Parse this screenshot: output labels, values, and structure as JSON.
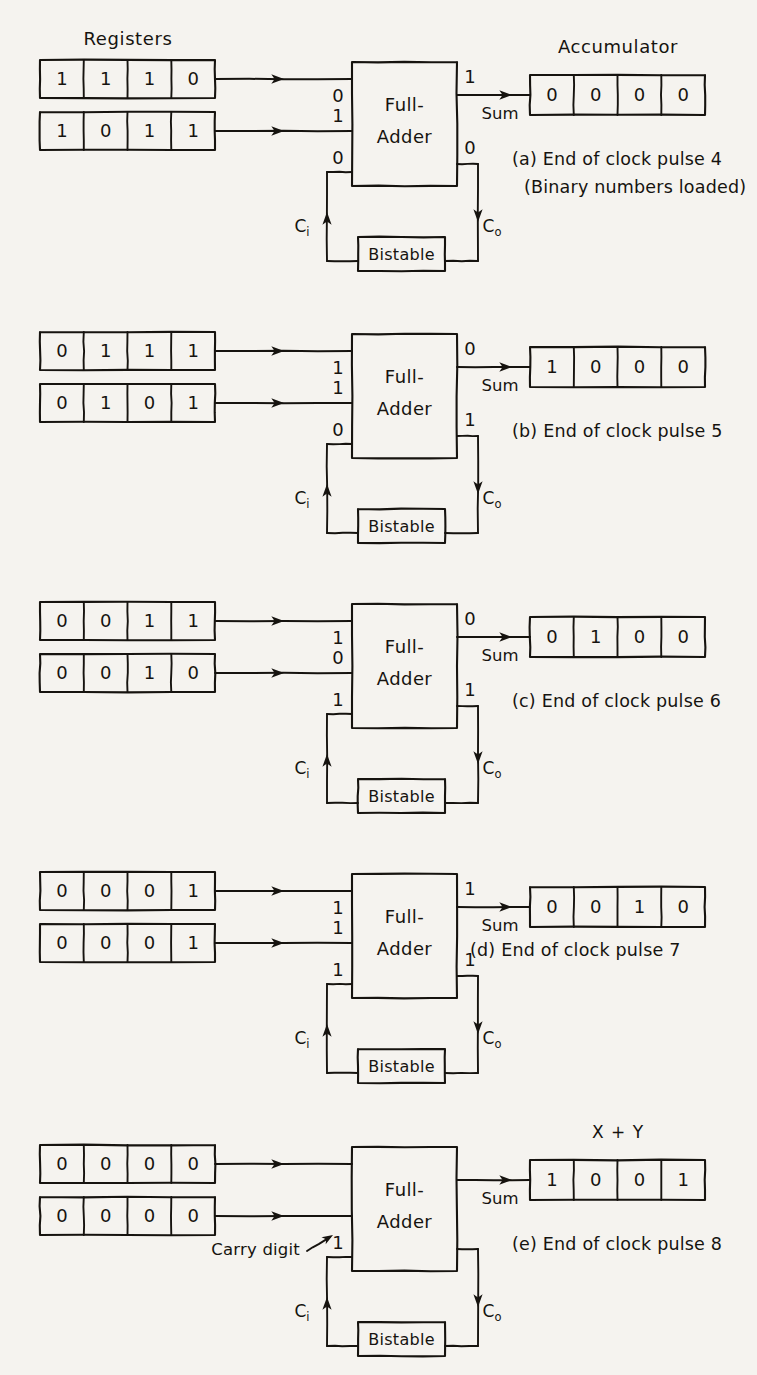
{
  "figure": {
    "headings": {
      "registers": "Registers",
      "accumulator": "Accumulator",
      "result": "X + Y"
    },
    "blocks": {
      "full_adder_line1": "Full-",
      "full_adder_line2": "Adder",
      "bistable": "Bistable"
    },
    "signals": {
      "sum": "Sum",
      "carry_in": "C",
      "carry_in_sub": "i",
      "carry_out": "C",
      "carry_out_sub": "o",
      "carry_digit_annotation": "Carry digit"
    },
    "ink_color": "#16130f",
    "paper_color": "#f5f3ef"
  },
  "panels": [
    {
      "id": "a",
      "caption_line1": "(a) End of clock pulse 4",
      "caption_line2": "(Binary numbers loaded)",
      "show_registers_heading": true,
      "show_accumulator_heading": true,
      "show_result_heading": false,
      "register_x": [
        "1",
        "1",
        "1",
        "0"
      ],
      "register_y": [
        "1",
        "0",
        "1",
        "1"
      ],
      "accumulator": [
        "0",
        "0",
        "0",
        "0"
      ],
      "input_top_bit": "0",
      "input_bottom_bit": "1",
      "carry_in_bit": "0",
      "sum_bit": "1",
      "carry_out_bit": "0",
      "show_carry_digit_annotation": false,
      "caption_layout": "two-line-below"
    },
    {
      "id": "b",
      "caption_line1": "(b) End of clock pulse 5",
      "caption_line2": "",
      "show_registers_heading": false,
      "show_accumulator_heading": false,
      "show_result_heading": false,
      "register_x": [
        "0",
        "1",
        "1",
        "1"
      ],
      "register_y": [
        "0",
        "1",
        "0",
        "1"
      ],
      "accumulator": [
        "1",
        "0",
        "0",
        "0"
      ],
      "input_top_bit": "1",
      "input_bottom_bit": "1",
      "carry_in_bit": "0",
      "sum_bit": "0",
      "carry_out_bit": "1",
      "show_carry_digit_annotation": false,
      "caption_layout": "single-mid"
    },
    {
      "id": "c",
      "caption_line1": "(c) End of clock pulse 6",
      "caption_line2": "",
      "show_registers_heading": false,
      "show_accumulator_heading": false,
      "show_result_heading": false,
      "register_x": [
        "0",
        "0",
        "1",
        "1"
      ],
      "register_y": [
        "0",
        "0",
        "1",
        "0"
      ],
      "accumulator": [
        "0",
        "1",
        "0",
        "0"
      ],
      "input_top_bit": "1",
      "input_bottom_bit": "0",
      "carry_in_bit": "1",
      "sum_bit": "0",
      "carry_out_bit": "1",
      "show_carry_digit_annotation": false,
      "caption_layout": "single-mid"
    },
    {
      "id": "d",
      "caption_line1": "(d)  End of  clock pulse 7",
      "caption_line2": "",
      "show_registers_heading": false,
      "show_accumulator_heading": false,
      "show_result_heading": false,
      "register_x": [
        "0",
        "0",
        "0",
        "1"
      ],
      "register_y": [
        "0",
        "0",
        "0",
        "1"
      ],
      "accumulator": [
        "0",
        "0",
        "1",
        "0"
      ],
      "input_top_bit": "1",
      "input_bottom_bit": "1",
      "carry_in_bit": "1",
      "sum_bit": "1",
      "carry_out_bit": "1",
      "show_carry_digit_annotation": false,
      "caption_layout": "single-low"
    },
    {
      "id": "e",
      "caption_line1": "(e) End of clock pulse 8",
      "caption_line2": "",
      "show_registers_heading": false,
      "show_accumulator_heading": false,
      "show_result_heading": true,
      "register_x": [
        "0",
        "0",
        "0",
        "0"
      ],
      "register_y": [
        "0",
        "0",
        "0",
        "0"
      ],
      "accumulator": [
        "1",
        "0",
        "0",
        "1"
      ],
      "input_top_bit": "",
      "input_bottom_bit": "",
      "carry_in_bit": "1",
      "sum_bit": "",
      "carry_out_bit": "",
      "show_carry_digit_annotation": true,
      "caption_layout": "single-mid"
    }
  ]
}
